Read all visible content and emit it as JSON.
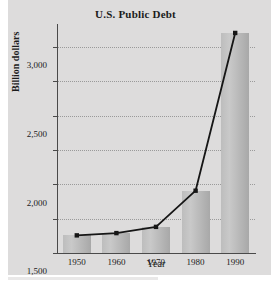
{
  "chart_data": {
    "type": "bar",
    "title": "U.S. Public Debt",
    "xlabel": "Year",
    "ylabel": "Billion dollars",
    "categories": [
      "1950",
      "1960",
      "1970",
      "1980",
      "1990"
    ],
    "values": [
      257,
      290,
      381,
      908,
      3207
    ],
    "series": [
      {
        "name": "U.S. Public Debt",
        "type": "bar",
        "values": [
          257,
          290,
          381,
          908,
          3207
        ]
      },
      {
        "name": "U.S. Public Debt trend",
        "type": "line",
        "values": [
          257,
          290,
          381,
          908,
          3207
        ]
      }
    ],
    "ylim": [
      0,
      3250
    ],
    "yticks": [
      0,
      500,
      1000,
      1500,
      2000,
      2500,
      3000
    ],
    "ytick_labels": [
      "0",
      "500",
      "1,000",
      "1,500",
      "2,000",
      "2,500",
      "3,000"
    ],
    "xtick_labels": [
      "1950",
      "1960",
      "1970",
      "1980",
      "1990"
    ],
    "grid": "horizontal-dotted",
    "legend": "none",
    "colors": {
      "background": "#dddcdc",
      "bar_light": "#c9c9c9",
      "bar_dark": "#a8a8a8",
      "line": "#161616",
      "axis": "#4a4a4a",
      "gridline": "#9a9a9a",
      "text": "#1b1b1b"
    }
  }
}
